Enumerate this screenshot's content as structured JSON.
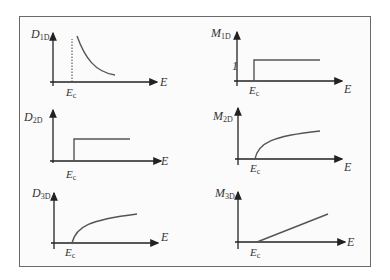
{
  "figure": {
    "panels": [
      {
        "id": "D1D",
        "ylabel": "D",
        "ysub": "1D",
        "xlabel": "E",
        "threshold_label": "E",
        "threshold_sub": "c",
        "shape": "inverse-sqrt decay after Ec with dotted line at Ec"
      },
      {
        "id": "M1D",
        "ylabel": "M",
        "ysub": "1D",
        "xlabel": "E",
        "threshold_label": "E",
        "threshold_sub": "c",
        "step_label": "1",
        "shape": "step at Ec to constant 1"
      },
      {
        "id": "D2D",
        "ylabel": "D",
        "ysub": "2D",
        "xlabel": "E",
        "threshold_label": "E",
        "threshold_sub": "c",
        "shape": "step at Ec to constant"
      },
      {
        "id": "M2D",
        "ylabel": "M",
        "ysub": "2D",
        "xlabel": "E",
        "threshold_label": "E",
        "threshold_sub": "c",
        "shape": "sqrt growth from Ec"
      },
      {
        "id": "D3D",
        "ylabel": "D",
        "ysub": "3D",
        "xlabel": "E",
        "threshold_label": "E",
        "threshold_sub": "c",
        "shape": "sqrt growth from Ec"
      },
      {
        "id": "M3D",
        "ylabel": "M",
        "ysub": "3D",
        "xlabel": "E",
        "threshold_label": "E",
        "threshold_sub": "c",
        "shape": "linear growth from Ec"
      }
    ]
  },
  "colors": {
    "axis": "#222222",
    "curve": "#555555",
    "frame": "#6a6a6a"
  }
}
